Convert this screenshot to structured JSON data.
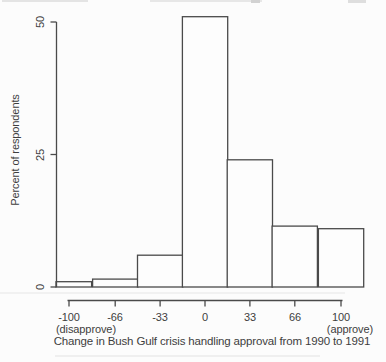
{
  "figure": {
    "background": "#fcfcfc",
    "axis_color": "#4a4a4a",
    "text_color": "#3e3e3e",
    "bar_fill": "#fdfdfd"
  },
  "chart_data": {
    "type": "bar",
    "subtype": "histogram-outline",
    "title": "",
    "xlabel": "Change in Bush Gulf crisis handling approval from 1990 to 1991",
    "ylabel": "Percent of respondents",
    "categories": [
      -100,
      -66,
      -33,
      0,
      33,
      66,
      100
    ],
    "x_tick_labels": [
      "-100",
      "-66",
      "-33",
      "0",
      "33",
      "66",
      "100"
    ],
    "x_end_annotations": {
      "left": "(disapprove)",
      "right": "(approve)"
    },
    "values": [
      1,
      1.5,
      6,
      51,
      24,
      11.5,
      11
    ],
    "yticks": [
      0,
      25,
      50
    ],
    "ytick_labels": [
      "0",
      "25",
      "50"
    ],
    "ylim": [
      0,
      51
    ],
    "xlim": [
      -117,
      117
    ],
    "bin_width": 33.3,
    "grid": false,
    "legend": null
  }
}
